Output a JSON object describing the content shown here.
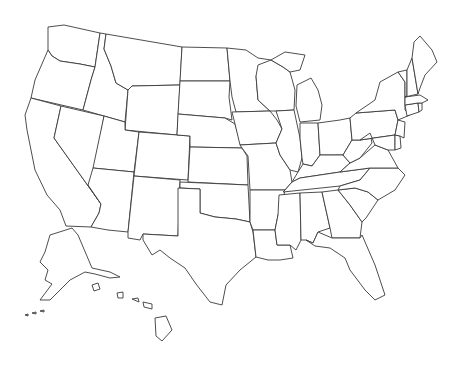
{
  "map": {
    "title": "",
    "type": "blank outline map",
    "region": "United States",
    "labels_shown": false,
    "colors": {
      "background": "#ffffff",
      "fill": "#ffffff",
      "border": "#3a3a3a"
    },
    "states": [
      "Washington",
      "Oregon",
      "California",
      "Idaho",
      "Nevada",
      "Montana",
      "Wyoming",
      "Utah",
      "Arizona",
      "Colorado",
      "New Mexico",
      "North Dakota",
      "South Dakota",
      "Nebraska",
      "Kansas",
      "Oklahoma",
      "Texas",
      "Minnesota",
      "Iowa",
      "Missouri",
      "Arkansas",
      "Louisiana",
      "Wisconsin",
      "Illinois",
      "Michigan",
      "Indiana",
      "Ohio",
      "Kentucky",
      "Tennessee",
      "Mississippi",
      "Alabama",
      "Georgia",
      "Florida",
      "South Carolina",
      "North Carolina",
      "Virginia",
      "West Virginia",
      "Pennsylvania",
      "New York",
      "Maryland",
      "Delaware",
      "New Jersey",
      "Connecticut",
      "Rhode Island",
      "Massachusetts",
      "Vermont",
      "New Hampshire",
      "Maine",
      "Alaska",
      "Hawaii"
    ]
  }
}
